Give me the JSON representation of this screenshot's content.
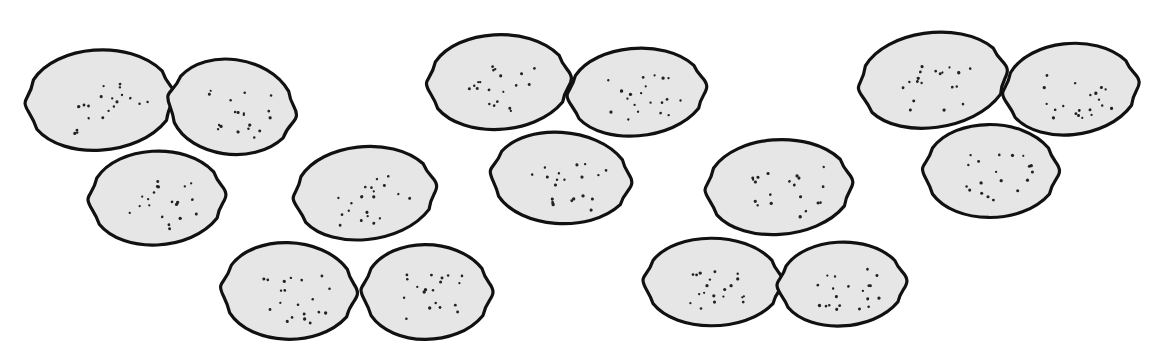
{
  "image": {
    "description": "Black-and-white line drawing of fifteen lemons arranged in five clusters of three, on a white background",
    "width": 1157,
    "height": 360,
    "background": "#ffffff",
    "fill_color": "#e6e6e6",
    "outline_color": "#111111",
    "dot_color": "#222222"
  },
  "groups": [
    {
      "name": "group-1",
      "lemons": [
        {
          "cx": 100,
          "cy": 100,
          "w": 150,
          "h": 110,
          "rot": -4
        },
        {
          "cx": 232,
          "cy": 107,
          "w": 130,
          "h": 104,
          "rot": 8
        },
        {
          "cx": 157,
          "cy": 198,
          "w": 138,
          "h": 103,
          "rot": -3
        }
      ]
    },
    {
      "name": "group-2",
      "lemons": [
        {
          "cx": 365,
          "cy": 193,
          "w": 144,
          "h": 102,
          "rot": -6
        },
        {
          "cx": 289,
          "cy": 291,
          "w": 137,
          "h": 106,
          "rot": 2
        },
        {
          "cx": 427,
          "cy": 292,
          "w": 132,
          "h": 104,
          "rot": 0
        }
      ]
    },
    {
      "name": "group-3",
      "lemons": [
        {
          "cx": 499,
          "cy": 82,
          "w": 145,
          "h": 104,
          "rot": -3
        },
        {
          "cx": 637,
          "cy": 92,
          "w": 140,
          "h": 96,
          "rot": -5
        },
        {
          "cx": 561,
          "cy": 178,
          "w": 142,
          "h": 100,
          "rot": 4
        }
      ]
    },
    {
      "name": "group-4",
      "lemons": [
        {
          "cx": 779,
          "cy": 187,
          "w": 148,
          "h": 104,
          "rot": -4
        },
        {
          "cx": 713,
          "cy": 282,
          "w": 140,
          "h": 96,
          "rot": 0
        },
        {
          "cx": 842,
          "cy": 284,
          "w": 130,
          "h": 92,
          "rot": -3
        }
      ]
    },
    {
      "name": "group-5",
      "lemons": [
        {
          "cx": 933,
          "cy": 80,
          "w": 150,
          "h": 104,
          "rot": -8
        },
        {
          "cx": 1071,
          "cy": 89,
          "w": 137,
          "h": 100,
          "rot": -6
        },
        {
          "cx": 991,
          "cy": 171,
          "w": 137,
          "h": 102,
          "rot": 0
        }
      ]
    }
  ]
}
